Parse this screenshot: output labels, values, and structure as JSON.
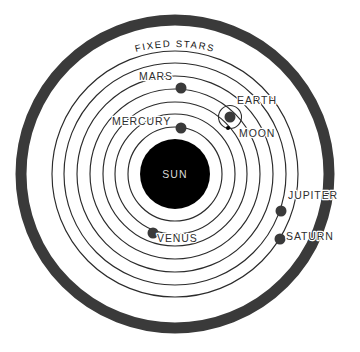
{
  "diagram": {
    "type": "astronomical-diagram",
    "background_color": "#ffffff",
    "center": {
      "x": 175,
      "y": 174
    },
    "outer_ring": {
      "label": "FIXED STARS",
      "radius": 154,
      "thickness": 11,
      "color": "#3a3a3a"
    },
    "sun": {
      "label": "SUN",
      "radius": 35,
      "color": "#000000",
      "label_color": "#d8d8d8"
    },
    "orbits": [
      {
        "name": "mercury-orbit",
        "radius": 47
      },
      {
        "name": "venus-orbit",
        "radius": 60
      },
      {
        "name": "earth-orbit",
        "radius": 72
      },
      {
        "name": "mars-orbit",
        "radius": 85
      },
      {
        "name": "jupiter-orbit",
        "radius": 98
      },
      {
        "name": "saturn-orbit",
        "radius": 111
      },
      {
        "name": "outer-orbit",
        "radius": 123
      }
    ],
    "bodies": [
      {
        "name": "mercury",
        "label": "MERCURY",
        "x": 181,
        "y": 128,
        "r": 5.5,
        "label_x": 112,
        "label_y": 125,
        "anchor": "start"
      },
      {
        "name": "venus",
        "label": "VENUS",
        "x": 153,
        "y": 233,
        "r": 5.5,
        "label_x": 157,
        "label_y": 242,
        "anchor": "start"
      },
      {
        "name": "earth",
        "label": "EARTH",
        "x": 230,
        "y": 117,
        "r": 5.5,
        "label_x": 237,
        "label_y": 104,
        "anchor": "start"
      },
      {
        "name": "mars",
        "label": "MARS",
        "x": 181,
        "y": 88,
        "r": 5.5,
        "label_x": 139,
        "label_y": 80,
        "anchor": "start"
      },
      {
        "name": "jupiter",
        "label": "JUPITER",
        "x": 281,
        "y": 211,
        "r": 5.5,
        "label_x": 288,
        "label_y": 199,
        "anchor": "start"
      },
      {
        "name": "saturn",
        "label": "SATURN",
        "x": 280,
        "y": 239,
        "r": 5.5,
        "label_x": 286,
        "label_y": 240,
        "anchor": "start"
      }
    ],
    "moon": {
      "label": "MOON",
      "x": 228,
      "y": 128,
      "r": 2.0,
      "orbit_cx": 230,
      "orbit_cy": 117,
      "orbit_r": 11.5,
      "label_x": 239,
      "label_y": 137,
      "anchor": "start"
    },
    "labels_color": "#2e2e2e"
  }
}
